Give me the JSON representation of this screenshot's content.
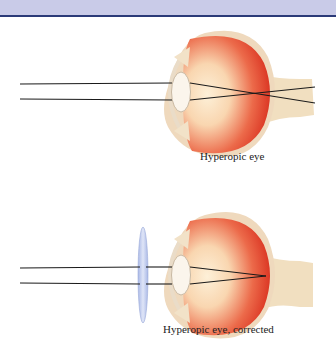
{
  "header": {
    "band_color": "#c9cbe8",
    "rule_color": "#2b3a78"
  },
  "figures": [
    {
      "id": "top",
      "caption": "Hyperopic eye",
      "corrective_lens": false,
      "focus": "behind retina"
    },
    {
      "id": "bottom",
      "caption": "Hyperopic eye, corrected",
      "corrective_lens": true,
      "focus": "on retina"
    }
  ],
  "colors": {
    "eyeball_red": "#e8402c",
    "eyeball_center": "#fbe6c8",
    "sclera": "#efd9bd",
    "optic_nerve": "#f1dfc0",
    "crystalline_lens": "#fbf5ec",
    "corrective_lens": "#b9c6ec",
    "ray": "#1a1a1a"
  }
}
